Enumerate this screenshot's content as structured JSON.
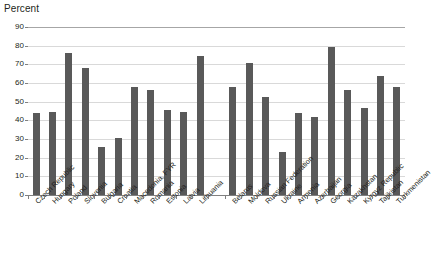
{
  "chart_data": {
    "type": "bar",
    "title": "Percent",
    "xlabel": "",
    "ylabel": "Percent",
    "ylim": [
      0,
      90
    ],
    "ytick_values": [
      0,
      10,
      20,
      30,
      40,
      50,
      60,
      70,
      80,
      90
    ],
    "ytick_labels": [
      "0",
      "10",
      "20",
      "30",
      "40",
      "50",
      "60",
      "70",
      "80",
      "90"
    ],
    "grid": true,
    "legend": "none",
    "bar_color": "#595959",
    "gridline_color": "#d9d9d9",
    "axis_color": "#808080",
    "categories": [
      "Czech Republic",
      "Hungary",
      "Poland",
      "Slovenia",
      "Bulgaria",
      "Croatia",
      "Macedonia, FYR",
      "Romania",
      "Estonia",
      "Latvia",
      "Lithuania",
      "",
      "Belarus",
      "Moldova",
      "Russian Federation",
      "Ukraine",
      "Armenia",
      "Azerbaijan",
      "Georgia",
      "Kazakhstan",
      "Kyrgyz Republic",
      "Tajikistan",
      "Turkmenistan"
    ],
    "values": [
      44,
      44.5,
      76,
      68,
      25.5,
      30.5,
      58,
      56.5,
      45.5,
      44.5,
      74.5,
      null,
      58,
      70.5,
      52.5,
      23,
      44,
      42,
      79.5,
      56,
      46.5,
      63.5,
      58
    ],
    "series": [
      {
        "name": "Percent",
        "values": [
          44,
          44.5,
          76,
          68,
          25.5,
          30.5,
          58,
          56.5,
          45.5,
          44.5,
          74.5,
          null,
          58,
          70.5,
          52.5,
          23,
          44,
          42,
          79.5,
          56,
          46.5,
          63.5,
          58
        ]
      }
    ],
    "group_gap_after_index": 10
  }
}
